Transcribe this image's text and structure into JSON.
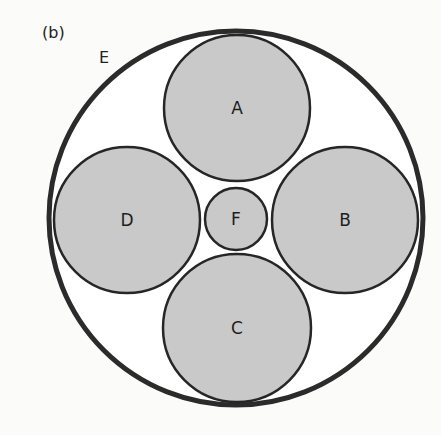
{
  "figure": {
    "panel_label": "(b)",
    "outer_circle": {
      "label": "E",
      "cx": 236,
      "cy": 218,
      "r": 187,
      "stroke": "#2b2b2b",
      "stroke_width": 5,
      "fill": "#ffffff"
    },
    "inner_circles": [
      {
        "label": "A",
        "cx": 237,
        "cy": 108,
        "r": 73
      },
      {
        "label": "B",
        "cx": 345,
        "cy": 220,
        "r": 73
      },
      {
        "label": "C",
        "cx": 237,
        "cy": 328,
        "r": 74
      },
      {
        "label": "D",
        "cx": 127,
        "cy": 220,
        "r": 73
      },
      {
        "label": "F",
        "cx": 236,
        "cy": 219,
        "r": 31
      }
    ],
    "colors": {
      "inner_fill": "#c9c9c9",
      "inner_stroke": "#262626",
      "background": "#fbfbfa"
    }
  }
}
